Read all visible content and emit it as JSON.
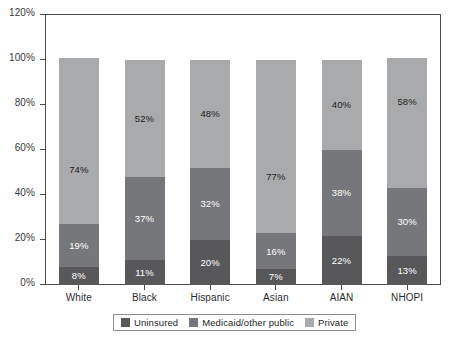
{
  "chart_data": {
    "type": "bar",
    "stacked": true,
    "stack_normalized_to": 100,
    "title": "",
    "subtitle": "",
    "xlabel": "",
    "ylabel": "",
    "ylim": [
      0,
      120
    ],
    "ytick_step": 20,
    "yticks": [
      "0%",
      "20%",
      "40%",
      "60%",
      "80%",
      "100%",
      "120%"
    ],
    "ytick_values": [
      0,
      20,
      40,
      60,
      80,
      100,
      120
    ],
    "grid": false,
    "legend_position": "bottom",
    "categories": [
      "White",
      "Black",
      "Hispanic",
      "Asian",
      "AIAN",
      "NHOPI"
    ],
    "series": [
      {
        "name": "Uninsured",
        "color": "#58585a",
        "values": [
          8,
          11,
          20,
          7,
          22,
          13
        ],
        "labels": [
          "8%",
          "11%",
          "20%",
          "7%",
          "22%",
          "13%"
        ]
      },
      {
        "name": "Medicaid/other public",
        "color": "#76777a",
        "values": [
          19,
          37,
          32,
          16,
          38,
          30
        ],
        "labels": [
          "19%",
          "37%",
          "32%",
          "16%",
          "38%",
          "30%"
        ]
      },
      {
        "name": "Private",
        "color": "#a9aaac",
        "values": [
          74,
          52,
          48,
          77,
          40,
          58
        ],
        "labels": [
          "74%",
          "52%",
          "48%",
          "77%",
          "40%",
          "58%"
        ]
      }
    ]
  },
  "legend": {
    "items": [
      {
        "label": "Uninsured",
        "color": "#58585a"
      },
      {
        "label": "Medicaid/other public",
        "color": "#76777a"
      },
      {
        "label": "Private",
        "color": "#a9aaac"
      }
    ]
  },
  "footnote": {
    "text": ""
  }
}
